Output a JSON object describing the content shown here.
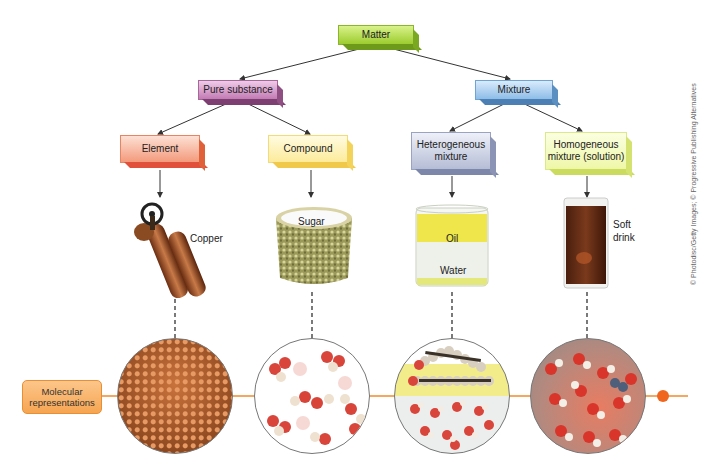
{
  "diagram": {
    "root": "Matter",
    "level1": [
      "Pure substance",
      "Mixture"
    ],
    "level2": [
      "Element",
      "Compound",
      "Heterogeneous mixture",
      "Homogeneous mixture (solution)"
    ],
    "examples": {
      "element": "Copper",
      "compound": "Sugar",
      "hetero_top": "Oil",
      "hetero_bottom": "Water",
      "homo_line1": "Soft",
      "homo_line2": "drink"
    },
    "hetero_line1": "Heterogeneous",
    "hetero_line2": "mixture",
    "homo_line1": "Homogeneous",
    "homo_line2": "mixture (solution)",
    "molecular_line1": "Molecular",
    "molecular_line2": "representations",
    "credit": "© Photodisc/Getty Images; © Progressive Publishing Alternatives"
  },
  "colors": {
    "matter": "#9ccc2e",
    "pure_substance": "#c27bb4",
    "mixture": "#8dbde7",
    "element": "#f39a7b",
    "compound": "#fdeb9a",
    "heterogeneous": "#b5bdd6",
    "homogeneous": "#eef7a8",
    "molecular_line": "#f08a2c"
  }
}
